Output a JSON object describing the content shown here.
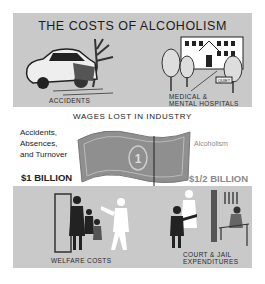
{
  "header": {
    "title": "THE COSTS OF ALCOHOLISM"
  },
  "top": {
    "accidents_label": "ACCIDENTS",
    "hospitals_label_1": "MEDICAL &",
    "hospitals_label_2": "MENTAL HOSPITALS",
    "hospital_sign": "QUIET"
  },
  "middle": {
    "title": "WAGES LOST IN INDUSTRY",
    "left_lines": [
      "Accidents,",
      "Absences,",
      "and Turnover"
    ],
    "left_amount": "$1 BILLION",
    "right_label": "Alcoholism",
    "right_amount": "$1/2 BILLION",
    "bill_denomination": "1"
  },
  "bottom": {
    "welfare_label": "WELFARE COSTS",
    "court_label_1": "COURT & JAIL",
    "court_label_2": "EXPENDITURES"
  },
  "colors": {
    "panel": "#c9c9c9",
    "bill": "#8f8f8f",
    "ink": "#222222"
  }
}
